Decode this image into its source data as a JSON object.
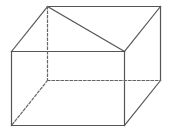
{
  "diagram": {
    "title": "",
    "type": "cuboid-wireframe",
    "stroke_color": "#555555",
    "dash_color": "#666666",
    "background": "#ffffff",
    "vertices": {
      "A": [
        11,
        51
      ],
      "B": [
        124,
        51
      ],
      "C": [
        124,
        125
      ],
      "D": [
        11,
        125
      ],
      "E": [
        47,
        6
      ],
      "F": [
        160,
        6
      ],
      "G": [
        160,
        80
      ],
      "H": [
        47,
        80
      ]
    },
    "edges": [
      {
        "name": "front-top-edge",
        "from": "A",
        "to": "B",
        "style": "solid"
      },
      {
        "name": "front-right-edge",
        "from": "B",
        "to": "C",
        "style": "solid"
      },
      {
        "name": "front-bottom-edge",
        "from": "C",
        "to": "D",
        "style": "solid"
      },
      {
        "name": "front-left-edge",
        "from": "D",
        "to": "A",
        "style": "solid"
      },
      {
        "name": "top-left-edge",
        "from": "A",
        "to": "E",
        "style": "solid"
      },
      {
        "name": "back-top-edge",
        "from": "E",
        "to": "F",
        "style": "solid"
      },
      {
        "name": "top-right-edge",
        "from": "F",
        "to": "B",
        "style": "solid"
      },
      {
        "name": "back-right-edge",
        "from": "F",
        "to": "G",
        "style": "solid"
      },
      {
        "name": "bottom-right-edge",
        "from": "G",
        "to": "C",
        "style": "solid"
      },
      {
        "name": "top-face-diagonal",
        "from": "E",
        "to": "B",
        "style": "solid"
      },
      {
        "name": "hidden-back-left-edge",
        "from": "E",
        "to": "H",
        "style": "dashed"
      },
      {
        "name": "hidden-back-bottom-edge",
        "from": "H",
        "to": "G",
        "style": "dashed"
      },
      {
        "name": "hidden-bottom-left-edge",
        "from": "H",
        "to": "D",
        "style": "dashed"
      }
    ]
  }
}
